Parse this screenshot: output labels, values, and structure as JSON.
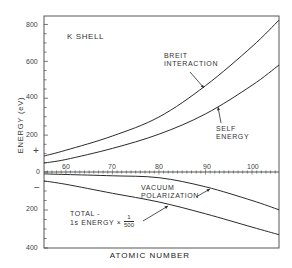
{
  "chart_data": {
    "type": "line",
    "title": "K SHELL",
    "xlabel": "ATOMIC NUMBER",
    "ylabel": "ENERGY (eV)",
    "xlim": [
      55.3,
      105.8
    ],
    "x_ticks": [
      60,
      70,
      80,
      90,
      100
    ],
    "x_tick_labels": [
      "60",
      "70",
      "80",
      "90",
      "100"
    ],
    "ylim_positive": [
      0,
      860
    ],
    "ylim_negative": [
      0,
      400
    ],
    "y_ticks_upper": [
      0,
      200,
      400,
      600,
      800
    ],
    "y_tick_labels_upper": [
      "0",
      "200",
      "400",
      "600",
      "800"
    ],
    "y_ticks_lower": [
      200,
      400
    ],
    "y_tick_labels_lower": [
      "200",
      "400"
    ],
    "sign_markers": {
      "upper": "+",
      "lower": "−"
    },
    "grid": false,
    "legend": "inline annotations with arrows",
    "series": [
      {
        "name": "BREIT INTERACTION",
        "sign": "positive",
        "x": [
          55.3,
          60,
          70,
          80,
          90,
          100,
          105.8
        ],
        "values": [
          87,
          118,
          195,
          298,
          468,
          680,
          824
        ]
      },
      {
        "name": "SELF ENERGY",
        "sign": "positive",
        "x": [
          55.3,
          60,
          70,
          80,
          90,
          100,
          105.8
        ],
        "values": [
          49,
          68,
          128,
          205,
          315,
          470,
          580
        ]
      },
      {
        "name": "VACUUM POLARIZATION",
        "sign": "negative",
        "x": [
          55.3,
          60,
          70,
          80,
          90,
          100,
          105.8
        ],
        "values": [
          10,
          13,
          20,
          30,
          78,
          150,
          199
        ]
      },
      {
        "name": "TOTAL - 1s ENERGY × 1/500",
        "sign": "negative",
        "x": [
          55.3,
          60,
          70,
          80,
          90,
          100,
          105.8
        ],
        "values": [
          47,
          65,
          112,
          158,
          220,
          290,
          330
        ]
      }
    ]
  },
  "labels": {
    "title": "K  SHELL",
    "ylabel": "ENERGY (eV)",
    "xlabel": "ATOMIC  NUMBER",
    "plus": "+",
    "minus": "−",
    "breit_line1": "BREIT",
    "breit_line2": "INTERACTION",
    "self_line1": "SELF",
    "self_line2": "ENERGY",
    "vac_line1": "VACUUM",
    "vac_line2": "POLARIZATION",
    "total_line1": "TOTAL -",
    "total_line2": "1s  ENERGY  ×",
    "frac_num": "1",
    "frac_den": "500"
  },
  "colors": {
    "line": "#2a2a2a",
    "frame": "#444444",
    "text": "#333333"
  }
}
